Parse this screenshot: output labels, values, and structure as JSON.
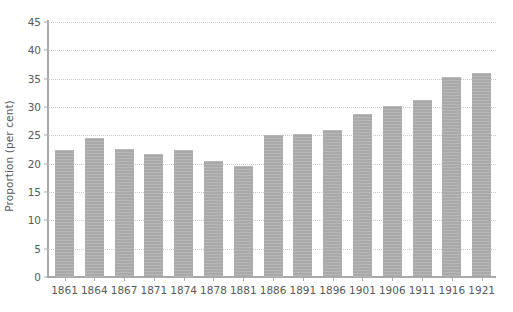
{
  "chart_data": {
    "type": "bar",
    "title": "",
    "xlabel": "",
    "ylabel": "Proportion (per cent)",
    "categories": [
      "1861",
      "1864",
      "1867",
      "1871",
      "1874",
      "1878",
      "1881",
      "1886",
      "1891",
      "1896",
      "1901",
      "1906",
      "1911",
      "1916",
      "1921"
    ],
    "values": [
      22.5,
      24.6,
      22.6,
      21.7,
      22.4,
      20.5,
      19.6,
      25.0,
      25.3,
      26.0,
      28.8,
      30.2,
      31.3,
      35.3,
      36.0
    ],
    "ylim": [
      0,
      45
    ],
    "ytick_values": [
      0,
      5,
      10,
      15,
      20,
      25,
      30,
      35,
      40,
      45
    ],
    "ytick_labels": [
      "0",
      "5",
      "10",
      "15",
      "20",
      "25",
      "30",
      "35",
      "40",
      "45"
    ],
    "grid": true,
    "legend": null,
    "series_name": "Proportion (per cent)",
    "bar_color": "#a9a9a9",
    "grid_color": "#c9c9c9",
    "axis_color": "#a9a9a9",
    "text_color": "#58595b"
  }
}
